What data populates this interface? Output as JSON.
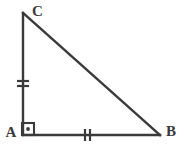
{
  "figure": {
    "kind": "geometry-diagram",
    "background_color": "#ffffff",
    "stroke_color": "#3a3a3a",
    "stroke_width": 2.4,
    "canvas": {
      "width": 182,
      "height": 150
    },
    "vertices": [
      {
        "id": "A",
        "label": "A",
        "x": 23,
        "y": 135,
        "label_x": 11,
        "label_y": 137
      },
      {
        "id": "B",
        "label": "B",
        "x": 160,
        "y": 135,
        "label_x": 166,
        "label_y": 136
      },
      {
        "id": "C",
        "label": "C",
        "x": 23,
        "y": 13,
        "label_x": 32,
        "label_y": 16
      }
    ],
    "sides": [
      {
        "id": "AC",
        "from": "A",
        "to": "C",
        "tick_count": 2,
        "tick_orientation": "horizontal"
      },
      {
        "id": "AB",
        "from": "A",
        "to": "B",
        "tick_count": 2,
        "tick_orientation": "vertical"
      },
      {
        "id": "CB",
        "from": "C",
        "to": "B",
        "tick_count": 0,
        "tick_orientation": "none"
      }
    ],
    "angle_marks": [
      {
        "id": "right-angle-A",
        "at_vertex": "A",
        "type": "right-angle-square-with-dot",
        "square_x": 22,
        "square_y": 123,
        "square_size": 12,
        "dot_radius": 1.9
      }
    ],
    "tick_marks": {
      "ac": [
        {
          "x1": 17,
          "y1": 81,
          "x2": 29,
          "y2": 81
        },
        {
          "x1": 17,
          "y1": 86,
          "x2": 29,
          "y2": 86
        }
      ],
      "ab": [
        {
          "x1": 85,
          "y1": 129,
          "x2": 85,
          "y2": 141
        },
        {
          "x1": 90,
          "y1": 129,
          "x2": 90,
          "y2": 141
        }
      ]
    }
  }
}
